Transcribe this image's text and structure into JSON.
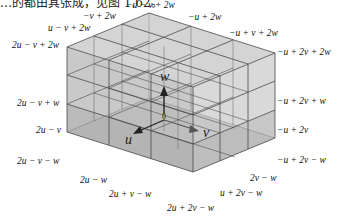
{
  "caption": "…的都由其张成，见图 1.62。",
  "diagram": {
    "axes": {
      "u": "u",
      "v": "v",
      "w": "w",
      "origin": "0"
    },
    "labels": {
      "top_back": "−u − v + 2w",
      "top_left_1": "−v + 2w",
      "top_left_2": "u − v + 2w",
      "top_left_corner": "2u − v + 2w",
      "top_right_1": "−u + 2w",
      "top_right_2": "−u + v + 2w",
      "top_right_corner": "−u + 2v + 2w",
      "left_1": "2u − v + w",
      "left_2": "2u − v",
      "left_bottom": "2u − v − w",
      "right_1": "−u + 2v + w",
      "right_2": "−u + 2v",
      "right_bottom": "−u + 2v − w",
      "bottom_left_1": "2u − w",
      "bottom_left_2": "2u + v − w",
      "bottom_right_1": "2v − w",
      "bottom_right_2": "u + 2v − w",
      "bottom_front": "2u + 2v − w"
    },
    "colors": {
      "face": "#c8c8c8",
      "face_dark": "#a9a9a9",
      "line": "#555555",
      "arrow": "#222222"
    }
  }
}
